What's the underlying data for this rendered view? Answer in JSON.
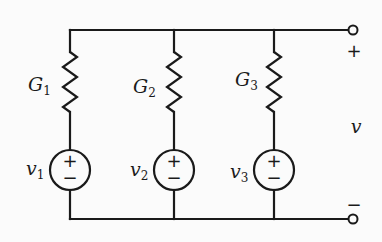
{
  "diagram": {
    "type": "circuit",
    "branches": [
      {
        "conductance": {
          "symbol": "G",
          "subscript": "1"
        },
        "source": {
          "symbol": "v",
          "subscript": "1",
          "polarity_top": "+",
          "polarity_bottom": "−"
        }
      },
      {
        "conductance": {
          "symbol": "G",
          "subscript": "2"
        },
        "source": {
          "symbol": "v",
          "subscript": "2",
          "polarity_top": "+",
          "polarity_bottom": "−"
        }
      },
      {
        "conductance": {
          "symbol": "G",
          "subscript": "3"
        },
        "source": {
          "symbol": "v",
          "subscript": "3",
          "polarity_top": "+",
          "polarity_bottom": "−"
        }
      }
    ],
    "output": {
      "voltage_label": "v",
      "plus_sign": "+",
      "minus_sign": "−"
    },
    "colors": {
      "ink": "#1a1a1a",
      "background": "#fbfbfb"
    }
  }
}
